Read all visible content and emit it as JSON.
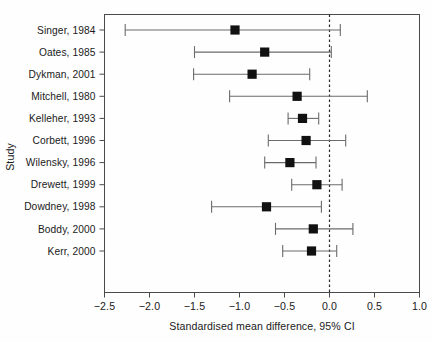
{
  "chart_data": {
    "type": "scatter",
    "subtype": "forest-plot",
    "title": "",
    "xlabel": "Standardised mean difference, 95% CI",
    "ylabel": "Study",
    "xlim": [
      -2.5,
      1.0
    ],
    "xticks": [
      -2.5,
      -2.0,
      -1.5,
      -1.0,
      -0.5,
      0.0,
      0.5,
      1.0
    ],
    "xticklabels": [
      "−2.5",
      "−2.0",
      "−1.5",
      "−1.0",
      "−0.5",
      "0.0",
      "0.5",
      "1.0"
    ],
    "grid": false,
    "legend": null,
    "reference_line": {
      "value": 0.0,
      "style": "dashed",
      "color": "#2a2a2a"
    },
    "marker_style": "filled-square",
    "marker_color": "#111111",
    "line_color": "#6b6b6b",
    "categories": [
      "Singer, 1984",
      "Oates, 1985",
      "Dykman, 2001",
      "Mitchell, 1980",
      "Kelleher, 1993",
      "Corbett, 1996",
      "Wilensky, 1996",
      "Drewett, 1999",
      "Dowdney, 1998",
      "Boddy, 2000",
      "Kerr, 2000"
    ],
    "points": [
      {
        "study": "Singer, 1984",
        "estimate": -1.05,
        "ci_low": -2.27,
        "ci_high": 0.12
      },
      {
        "study": "Oates, 1985",
        "estimate": -0.72,
        "ci_low": -1.5,
        "ci_high": 0.02
      },
      {
        "study": "Dykman, 2001",
        "estimate": -0.86,
        "ci_low": -1.51,
        "ci_high": -0.22
      },
      {
        "study": "Mitchell, 1980",
        "estimate": -0.36,
        "ci_low": -1.11,
        "ci_high": 0.42
      },
      {
        "study": "Kelleher, 1993",
        "estimate": -0.3,
        "ci_low": -0.46,
        "ci_high": -0.12
      },
      {
        "study": "Corbett, 1996",
        "estimate": -0.26,
        "ci_low": -0.68,
        "ci_high": 0.18
      },
      {
        "study": "Wilensky, 1996",
        "estimate": -0.44,
        "ci_low": -0.72,
        "ci_high": -0.15
      },
      {
        "study": "Drewett, 1999",
        "estimate": -0.14,
        "ci_low": -0.42,
        "ci_high": 0.14
      },
      {
        "study": "Dowdney, 1998",
        "estimate": -0.7,
        "ci_low": -1.31,
        "ci_high": -0.09
      },
      {
        "study": "Boddy, 2000",
        "estimate": -0.18,
        "ci_low": -0.6,
        "ci_high": 0.26
      },
      {
        "study": "Kerr, 2000",
        "estimate": -0.2,
        "ci_low": -0.52,
        "ci_high": 0.08
      }
    ]
  }
}
